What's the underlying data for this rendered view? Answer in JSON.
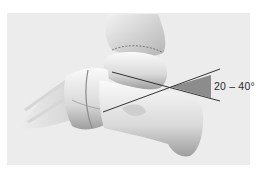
{
  "figure": {
    "angle_label": "20 – 40°",
    "colors": {
      "background": "#ffffff",
      "panel": "#ececec",
      "bone_light": "#f6f6f6",
      "bone_shadow": "#9a9a9a",
      "angle_fill": "#8c8c8c",
      "line": "#1e1e1e"
    }
  }
}
